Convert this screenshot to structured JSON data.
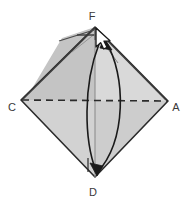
{
  "figure": {
    "background_color": "#ffffff",
    "shape": {
      "name": "rhombus",
      "fill_light": "#d4d4d4",
      "fill_mid": "#cacaca",
      "fill_dark": "#bfbfbf",
      "stroke": "#2b2b2b",
      "vertices": [
        {
          "label": "F",
          "x": 95,
          "y": 27,
          "position": "top"
        },
        {
          "label": "A",
          "x": 168,
          "y": 101,
          "position": "right"
        },
        {
          "label": "D",
          "x": 95,
          "y": 177,
          "position": "bottom"
        },
        {
          "label": "C",
          "x": 21,
          "y": 100,
          "position": "left"
        }
      ]
    },
    "labels": [
      {
        "name": "vertex-label-F",
        "text": "F",
        "x": 92,
        "y": 20
      },
      {
        "name": "vertex-label-A",
        "text": "A",
        "x": 174,
        "y": 110
      },
      {
        "name": "vertex-label-D",
        "text": "D",
        "x": 92,
        "y": 194
      },
      {
        "name": "vertex-label-C",
        "text": "C",
        "x": 10,
        "y": 110
      }
    ],
    "lines": {
      "dashed_fold": {
        "name": "dashed-fold-line-CA",
        "from": "C",
        "to": "A",
        "style": "dashed",
        "color": "#2b2b2b",
        "dash_pattern": "7 5"
      },
      "vertical_axis": {
        "name": "vertical-axis-FD",
        "from": "F",
        "to": "D",
        "style": "solid-thin",
        "color": "#8a8a8a"
      },
      "crease_left": {
        "name": "crease-line-F-left",
        "color": "#555555"
      },
      "crease_right": {
        "name": "crease-line-F-right",
        "color": "#555555"
      },
      "tab_line": {
        "name": "tab-line-at-F",
        "color": "#3a3a3a"
      }
    },
    "arrows": [
      {
        "name": "fold-arrow-D-to-F",
        "direction": "up",
        "from": "D",
        "to": "F",
        "color": "#1a1a1a",
        "style": "curved"
      },
      {
        "name": "fold-arrow-F-to-D",
        "direction": "down",
        "from": "F",
        "to": "D",
        "color": "#1a1a1a",
        "style": "curved"
      }
    ],
    "cursor": {
      "name": "mouse-cursor",
      "type": "arrow-pointer",
      "x": 97,
      "y": 31,
      "fill": "#ffffff",
      "stroke": "#1a1a1a"
    }
  }
}
